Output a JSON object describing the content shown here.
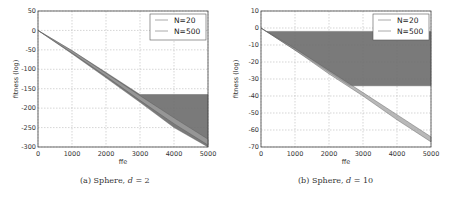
{
  "chart_data": [
    {
      "type": "area",
      "title": "",
      "caption": {
        "label": "(a)",
        "text": "Sphere,",
        "var": "d",
        "eq": "= 2"
      },
      "xlabel": "ffe",
      "ylabel": "fitness (log)",
      "xlim": [
        0,
        5000
      ],
      "ylim": [
        -300,
        50
      ],
      "xticks": [
        "0",
        "1000",
        "2000",
        "3000",
        "4000",
        "5000"
      ],
      "yticks": [
        "50",
        "0",
        "-50",
        "-100",
        "-150",
        "-200",
        "-250",
        "-300"
      ],
      "grid": true,
      "legend": {
        "position": "upper right",
        "entries": [
          "N=20",
          "N=500"
        ]
      },
      "series": [
        {
          "name": "N=20",
          "x": [
            0,
            1000,
            2000,
            3000,
            3200,
            4000,
            5000
          ],
          "lower": [
            0,
            -60,
            -122,
            -185,
            -198,
            -250,
            -300
          ],
          "upper": [
            0,
            -52,
            -108,
            -165,
            -165,
            -165,
            -165
          ]
        },
        {
          "name": "N=500",
          "x": [
            0,
            1000,
            2000,
            3000,
            4000,
            5000
          ],
          "lower": [
            0,
            -58,
            -118,
            -180,
            -240,
            -295
          ],
          "upper": [
            0,
            -52,
            -110,
            -168,
            -225,
            -280
          ]
        }
      ]
    },
    {
      "type": "area",
      "title": "",
      "caption": {
        "label": "(b)",
        "text": "Sphere,",
        "var": "d",
        "eq": "= 10"
      },
      "xlabel": "ffe",
      "ylabel": "fitness (log)",
      "xlim": [
        0,
        5000
      ],
      "ylim": [
        -70,
        10
      ],
      "xticks": [
        "0",
        "1000",
        "2000",
        "3000",
        "4000",
        "5000"
      ],
      "yticks": [
        "10",
        "0",
        "-10",
        "-20",
        "-30",
        "-40",
        "-50",
        "-60",
        "-70"
      ],
      "grid": true,
      "legend": {
        "position": "upper right",
        "entries": [
          "N=20",
          "N=500"
        ]
      },
      "series": [
        {
          "name": "N=20",
          "x": [
            0,
            150,
            1000,
            2000,
            2600,
            5000
          ],
          "lower": [
            0,
            -2,
            -13,
            -26,
            -34,
            -34
          ],
          "upper": [
            0,
            -2,
            -2,
            -2,
            -2,
            -2
          ]
        },
        {
          "name": "N=500",
          "x": [
            0,
            1000,
            2000,
            3000,
            4000,
            5000
          ],
          "lower": [
            0,
            -13,
            -27,
            -40,
            -54,
            -67
          ],
          "upper": [
            0,
            -12,
            -25,
            -38,
            -51,
            -64
          ]
        }
      ]
    }
  ]
}
